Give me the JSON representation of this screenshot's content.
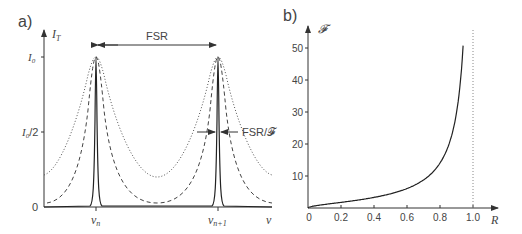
{
  "chart_data": [
    {
      "panel": "a)",
      "type": "line",
      "title": "",
      "xlabel": "ν",
      "ylabel": "I_T",
      "xticks": [
        "ν_n",
        "ν_n+1"
      ],
      "yticks": [
        "0",
        "I_0/2",
        "I_0"
      ],
      "grid": false,
      "annotations": [
        "FSR",
        "FSR/𝓕"
      ],
      "series": [
        {
          "name": "low finesse",
          "style": "dotted",
          "min_relative": 0.18,
          "max_relative": 1.0
        },
        {
          "name": "medium finesse",
          "style": "dashed",
          "min_relative": 0.03,
          "max_relative": 1.0
        },
        {
          "name": "high finesse",
          "style": "solid",
          "min_relative": 0.0,
          "max_relative": 1.0
        }
      ]
    },
    {
      "panel": "b)",
      "type": "line",
      "title": "",
      "xlabel": "R",
      "ylabel": "𝓕",
      "xlim": [
        0,
        1.0
      ],
      "ylim": [
        0,
        52
      ],
      "xticks": [
        "0",
        "0.2",
        "0.4",
        "0.6",
        "0.8",
        "1.0"
      ],
      "yticks": [
        "10",
        "20",
        "30",
        "40",
        "50"
      ],
      "grid": false,
      "annotations": [
        "dotted vertical line at R = 1.0"
      ],
      "series": [
        {
          "name": "Finesse F = π√R/(1−R)",
          "x": [
            0,
            0.1,
            0.2,
            0.3,
            0.4,
            0.5,
            0.6,
            0.7,
            0.8,
            0.85,
            0.9,
            0.94
          ],
          "y": [
            0,
            1.1,
            1.8,
            2.5,
            3.3,
            4.4,
            6.1,
            8.8,
            14.0,
            19.3,
            29.8,
            50.8
          ]
        }
      ]
    }
  ],
  "labels": {
    "panel_a": "a)",
    "panel_b": "b)",
    "a_ylabel": "I",
    "a_ylabel_sub": "T",
    "a_y_i0": "I",
    "a_y_i0_sub": "0",
    "a_y_half_sub": "0",
    "a_y_half_suffix": "/2",
    "a_y_zero": "0",
    "a_xlabel": "ν",
    "a_xtick1": "ν",
    "a_xtick1_sub": "n",
    "a_xtick2": "ν",
    "a_xtick2_sub": "n+1",
    "fsr": "FSR",
    "fsr_over_f": "FSR/𝓕",
    "b_ylabel": "𝓕",
    "b_xlabel": "R",
    "b_xticks": [
      "0",
      "0.2",
      "0.4",
      "0.6",
      "0.8",
      "1.0"
    ],
    "b_yticks": [
      "10",
      "20",
      "30",
      "40",
      "50"
    ]
  }
}
